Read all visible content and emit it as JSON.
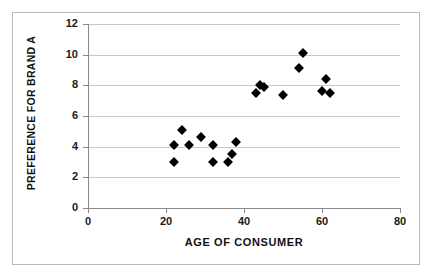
{
  "chart_data": {
    "type": "scatter",
    "title": "",
    "xlabel": "AGE OF CONSUMER",
    "ylabel": "PREFERENCE FOR BRAND A",
    "xlim": [
      0,
      80
    ],
    "ylim": [
      0,
      12
    ],
    "xticks": [
      0,
      20,
      40,
      60,
      80
    ],
    "yticks": [
      0,
      2,
      4,
      6,
      8,
      10,
      12
    ],
    "xtick_labels": [
      "0",
      "20",
      "40",
      "60",
      "80"
    ],
    "ytick_labels": [
      "0",
      "2",
      "4",
      "6",
      "8",
      "10",
      "12"
    ],
    "grid": "horizontal",
    "legend": "none",
    "marker": "filled-diamond",
    "marker_color": "#000000",
    "series": [
      {
        "name": "Consumers",
        "points": [
          {
            "x": 22,
            "y": 4.1
          },
          {
            "x": 22,
            "y": 3.0
          },
          {
            "x": 24,
            "y": 5.1
          },
          {
            "x": 26,
            "y": 4.1
          },
          {
            "x": 29,
            "y": 4.6
          },
          {
            "x": 32,
            "y": 4.1
          },
          {
            "x": 32,
            "y": 3.0
          },
          {
            "x": 36,
            "y": 3.0
          },
          {
            "x": 37,
            "y": 3.5
          },
          {
            "x": 38,
            "y": 4.3
          },
          {
            "x": 43,
            "y": 7.5
          },
          {
            "x": 44,
            "y": 8.0
          },
          {
            "x": 45,
            "y": 7.9
          },
          {
            "x": 50,
            "y": 7.4
          },
          {
            "x": 54,
            "y": 9.1
          },
          {
            "x": 55,
            "y": 10.1
          },
          {
            "x": 60,
            "y": 7.65
          },
          {
            "x": 61,
            "y": 8.4
          },
          {
            "x": 62,
            "y": 7.5
          }
        ]
      }
    ]
  },
  "figure": {
    "border_color": "#b9b9b9",
    "background": "#ffffff",
    "gridline_color": "#c8c8c8",
    "axis_color": "#8a8a8a"
  }
}
